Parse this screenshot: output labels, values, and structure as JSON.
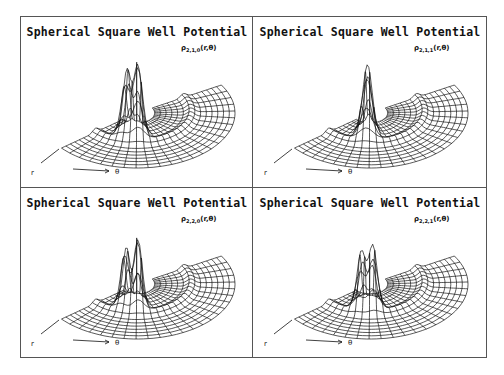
{
  "figure": {
    "background": "#ffffff",
    "line_color": "#111111",
    "border_color": "#555555"
  },
  "panels": [
    {
      "title": "Spherical Square Well Potential",
      "label_sym": "ρ",
      "label_sub": "2,1,0",
      "label_args": "(r,θ)",
      "axis_r": "r",
      "axis_theta": "θ"
    },
    {
      "title": "Spherical Square Well Potential",
      "label_sym": "ρ",
      "label_sub": "2,1,1",
      "label_args": "(r,θ)",
      "axis_r": "r",
      "axis_theta": "θ"
    },
    {
      "title": "Spherical Square Well Potential",
      "label_sym": "ρ",
      "label_sub": "2,2,0",
      "label_args": "(r,θ)",
      "axis_r": "r",
      "axis_theta": "θ"
    },
    {
      "title": "Spherical Square Well Potential",
      "label_sym": "ρ",
      "label_sub": "2,2,1",
      "label_args": "(r,θ)",
      "axis_r": "r",
      "axis_theta": "θ"
    }
  ],
  "chart_data": [
    {
      "type": "surface",
      "title": "Spherical Square Well Potential",
      "zlabel": "ρ_{2,1,0}(r,θ)",
      "xlabel": "r",
      "ylabel": "θ",
      "domain": "half-disk polar mesh, θ ∈ [0, π]",
      "grid": true,
      "peaks": [
        {
          "theta": 0.62,
          "r": 0.22,
          "height": 62,
          "width": 0.12
        },
        {
          "theta": 0.95,
          "r": 0.25,
          "height": 72,
          "width": 0.12
        }
      ]
    },
    {
      "type": "surface",
      "title": "Spherical Square Well Potential",
      "zlabel": "ρ_{2,1,1}(r,θ)",
      "xlabel": "r",
      "ylabel": "θ",
      "domain": "half-disk polar mesh, θ ∈ [0, π]",
      "grid": true,
      "peaks": [
        {
          "theta": 0.85,
          "r": 0.22,
          "height": 68,
          "width": 0.14
        }
      ]
    },
    {
      "type": "surface",
      "title": "Spherical Square Well Potential",
      "zlabel": "ρ_{2,2,0}(r,θ)",
      "xlabel": "r",
      "ylabel": "θ",
      "domain": "half-disk polar mesh, θ ∈ [0, π]",
      "grid": true,
      "peaks": [
        {
          "theta": 0.6,
          "r": 0.24,
          "height": 58,
          "width": 0.11
        },
        {
          "theta": 0.95,
          "r": 0.26,
          "height": 70,
          "width": 0.11
        }
      ]
    },
    {
      "type": "surface",
      "title": "Spherical Square Well Potential",
      "zlabel": "ρ_{2,2,1}(r,θ)",
      "xlabel": "r",
      "ylabel": "θ",
      "domain": "half-disk polar mesh, θ ∈ [0, π]",
      "grid": true,
      "peaks": [
        {
          "theta": 0.7,
          "r": 0.28,
          "height": 55,
          "width": 0.11
        },
        {
          "theta": 1.0,
          "r": 0.3,
          "height": 62,
          "width": 0.11
        }
      ]
    }
  ]
}
